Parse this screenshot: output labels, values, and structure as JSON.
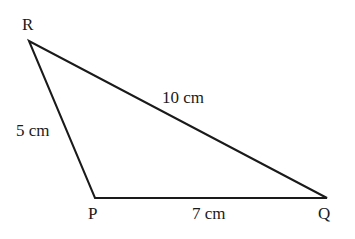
{
  "diagram": {
    "type": "triangle",
    "vertices": [
      {
        "name": "R",
        "x": 29,
        "y": 41
      },
      {
        "name": "P",
        "x": 95,
        "y": 198
      },
      {
        "name": "Q",
        "x": 327,
        "y": 198
      }
    ],
    "sides": [
      {
        "from": "R",
        "to": "P",
        "label": "5 cm"
      },
      {
        "from": "R",
        "to": "Q",
        "label": "10 cm"
      },
      {
        "from": "P",
        "to": "Q",
        "label": "7 cm"
      }
    ],
    "stroke_color": "#1a1a1a"
  },
  "labels": {
    "vertex_r": "R",
    "vertex_p": "P",
    "vertex_q": "Q",
    "side_rp": "5 cm",
    "side_rq": "10 cm",
    "side_pq": "7 cm"
  }
}
